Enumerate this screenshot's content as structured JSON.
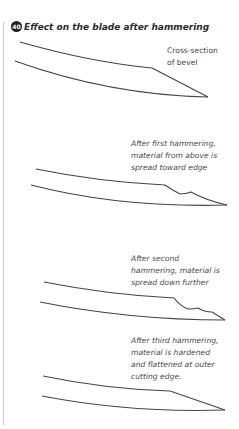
{
  "title": {
    "number": "40",
    "text": "Effect on the blade after hammering"
  },
  "stages": [
    {
      "caption_lines": [
        "Cross-section",
        "of bevel"
      ],
      "italic": false
    },
    {
      "caption_lines": [
        "After first hammering,",
        "material from above is",
        "spread toward edge"
      ],
      "italic": true
    },
    {
      "caption_lines": [
        "After second",
        "hammering, material is",
        "spread down further"
      ],
      "italic": true
    },
    {
      "caption_lines": [
        "After third hammering,",
        "material is hardened",
        "and flattened at outer",
        "cutting edge."
      ],
      "italic": true
    }
  ]
}
